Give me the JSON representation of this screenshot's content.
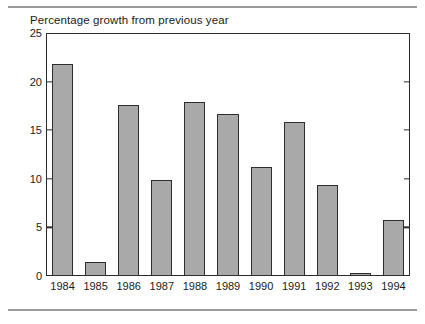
{
  "chart_data": {
    "type": "bar",
    "title": "Percentage growth from previous year",
    "xlabel": "",
    "ylabel": "",
    "categories": [
      "1984",
      "1985",
      "1986",
      "1987",
      "1988",
      "1989",
      "1990",
      "1991",
      "1992",
      "1993",
      "1994"
    ],
    "values": [
      21.8,
      1.4,
      17.6,
      9.9,
      17.9,
      16.7,
      11.2,
      15.8,
      9.4,
      0.3,
      5.8
    ],
    "ylim": [
      0,
      25
    ],
    "yticks": [
      0,
      5,
      10,
      15,
      20,
      25
    ],
    "ytick_labels": [
      "0",
      "5",
      "10",
      "15",
      "20",
      "25"
    ],
    "grid": false,
    "legend": null,
    "bar_color": "#a9a9a9",
    "bar_border_color": "#2e2e2e",
    "axis_color": "#2b2b2b",
    "background_color": "#ffffff",
    "ticks_on_right_axis": true
  }
}
